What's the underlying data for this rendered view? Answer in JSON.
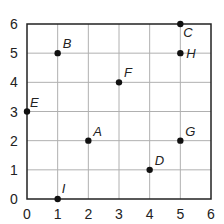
{
  "chart_data": {
    "type": "scatter",
    "title": "",
    "xlabel": "",
    "ylabel": "",
    "xlim": [
      0,
      6
    ],
    "ylim": [
      0,
      6
    ],
    "grid": true,
    "x_ticks": [
      "0",
      "1",
      "2",
      "3",
      "4",
      "5",
      "6"
    ],
    "y_ticks": [
      "0",
      "1",
      "2",
      "3",
      "4",
      "5",
      "6"
    ],
    "points": [
      {
        "label": "A",
        "x": 2,
        "y": 2
      },
      {
        "label": "B",
        "x": 1,
        "y": 5
      },
      {
        "label": "C",
        "x": 5,
        "y": 6
      },
      {
        "label": "D",
        "x": 4,
        "y": 1
      },
      {
        "label": "E",
        "x": 0,
        "y": 3
      },
      {
        "label": "F",
        "x": 3,
        "y": 4
      },
      {
        "label": "G",
        "x": 5,
        "y": 2
      },
      {
        "label": "H",
        "x": 5,
        "y": 5
      },
      {
        "label": "I",
        "x": 1,
        "y": 0
      }
    ],
    "colors": {
      "point": "#111111",
      "grid": "#b0b0b0",
      "axis": "#222222"
    }
  }
}
